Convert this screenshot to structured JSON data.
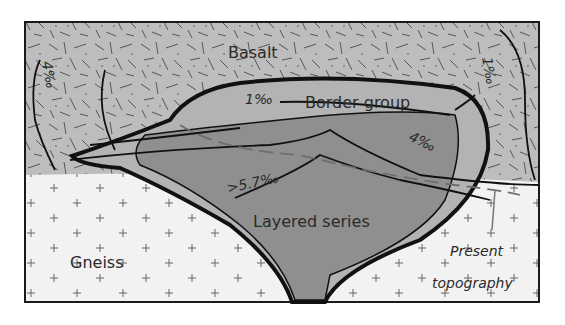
{
  "diagram": {
    "type": "geological-cross-section",
    "units": [
      {
        "id": "basalt",
        "label": "Basalt",
        "fill": "#bdbdbd",
        "pattern": "random dashes"
      },
      {
        "id": "gneiss",
        "label": "Gneiss",
        "fill": "#f2f2f2",
        "pattern": "crosses"
      },
      {
        "id": "border-group",
        "label": "Border group",
        "fill": "#b3b3b3"
      },
      {
        "id": "layered-series",
        "label": "Layered series",
        "fill": "#8f8f8f"
      }
    ],
    "contours": [
      {
        "label": "1‰",
        "position": "upper border group"
      },
      {
        "label": "4‰",
        "position": "right of layered series"
      },
      {
        "label": ">5.7‰",
        "position": "lower left of layered series"
      },
      {
        "label": "4‰",
        "position": "left basalt, vertical"
      },
      {
        "label": "1‰",
        "position": "right basalt, vertical"
      }
    ],
    "annotation": {
      "line1": "Present",
      "line2": "topography"
    },
    "colors": {
      "outline": "#1a1a1a",
      "dashed": "#6e6e6e",
      "text": "#2a2a2a"
    }
  }
}
